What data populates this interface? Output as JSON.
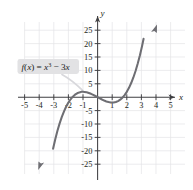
{
  "figure": {
    "background_color": "#ffffff",
    "grid_color": "#e3e3e6",
    "axis_color": "#3f3f42",
    "curve_color": "#6e6e73",
    "label_box_color": "#e2e2e4",
    "label_text_color": "#1a1a1a"
  },
  "axes": {
    "x_name": "x",
    "y_name": "y",
    "x_tick_labels": [
      "-5",
      "-4",
      "-3",
      "-2",
      "-1",
      "1",
      "2",
      "3",
      "4",
      "5"
    ],
    "x_tick_values": [
      -5,
      -4,
      -3,
      -2,
      -1,
      1,
      2,
      3,
      4,
      5
    ],
    "y_tick_labels": [
      "25",
      "20",
      "15",
      "10",
      "5",
      "-5",
      "-10",
      "-15",
      "-20",
      "-25"
    ],
    "y_tick_values": [
      25,
      20,
      15,
      10,
      5,
      -5,
      -10,
      -15,
      -20,
      -25
    ]
  },
  "annotation": {
    "function_label": "f(x) = x³ − 3x",
    "label_parts": {
      "f": "f",
      "open_paren": "(",
      "x1": "x",
      "close_paren": ")",
      "equals": " = ",
      "x2": "x",
      "exponent": "3",
      "minus": " − ",
      "coefficient": "3",
      "x3": "x"
    }
  },
  "chart_data": {
    "type": "line",
    "title": "",
    "xlabel": "x",
    "ylabel": "y",
    "xlim": [
      -5.6,
      5.6
    ],
    "ylim": [
      -27.5,
      28.5
    ],
    "grid": true,
    "x_major_step": 1,
    "y_major_step": 5,
    "legend_position": "none",
    "annotations": [
      {
        "text": "f(x) = x³ − 3x",
        "x": -3.6,
        "y": 10.5,
        "points_to_x": -1.0,
        "points_to_y": 2.0
      }
    ],
    "series": [
      {
        "name": "f(x) = x³ − 3x",
        "color": "#6e6e73",
        "arrow_start": true,
        "arrow_end": true,
        "x": [
          -3.05,
          -2.9,
          -2.75,
          -2.6,
          -2.45,
          -2.3,
          -2.15,
          -2.0,
          -1.85,
          -1.7,
          -1.55,
          -1.4,
          -1.25,
          -1.1,
          -1.0,
          -0.9,
          -0.75,
          -0.6,
          -0.45,
          -0.3,
          -0.15,
          0.0,
          0.15,
          0.3,
          0.45,
          0.6,
          0.75,
          0.9,
          1.0,
          1.1,
          1.25,
          1.4,
          1.55,
          1.7,
          1.85,
          2.0,
          2.15,
          2.3,
          2.45,
          2.6,
          2.75,
          2.9,
          3.05,
          3.15
        ],
        "y": [
          -19.22,
          -15.69,
          -12.55,
          -9.78,
          -7.36,
          -5.28,
          -3.49,
          -2.0,
          -0.78,
          0.19,
          0.92,
          1.46,
          1.8,
          2.0,
          2.0,
          1.97,
          1.83,
          1.58,
          1.26,
          0.87,
          0.45,
          0.0,
          -0.45,
          -0.87,
          -1.26,
          -1.58,
          -1.83,
          -1.97,
          -2.0,
          -2.0,
          -1.8,
          -1.46,
          -0.92,
          -0.19,
          0.78,
          2.0,
          3.49,
          5.28,
          7.36,
          9.78,
          12.55,
          15.69,
          19.22,
          21.82
        ],
        "roots": [
          -1.732,
          0,
          1.732
        ],
        "local_max": {
          "x": -1,
          "y": 2
        },
        "local_min": {
          "x": 1,
          "y": -2
        }
      }
    ]
  }
}
